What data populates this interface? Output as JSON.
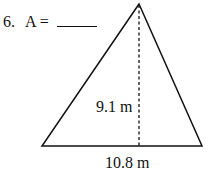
{
  "problem": {
    "number": "6.",
    "prompt": "A ="
  },
  "figure": {
    "shape": "triangle",
    "height_label": "9.1 m",
    "base_label": "10.8 m",
    "stroke_color": "#111111"
  }
}
